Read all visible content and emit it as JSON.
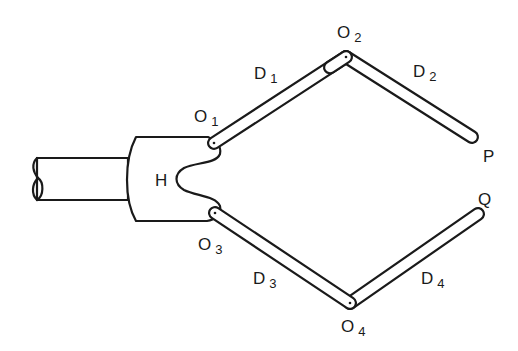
{
  "diagram": {
    "palm_label": "H",
    "joints": [
      {
        "id": "O1",
        "letter": "O",
        "sub": "1"
      },
      {
        "id": "O2",
        "letter": "O",
        "sub": "2"
      },
      {
        "id": "O3",
        "letter": "O",
        "sub": "3"
      },
      {
        "id": "O4",
        "letter": "O",
        "sub": "4"
      }
    ],
    "links": [
      {
        "id": "D1",
        "letter": "D",
        "sub": "1"
      },
      {
        "id": "D2",
        "letter": "D",
        "sub": "2"
      },
      {
        "id": "D3",
        "letter": "D",
        "sub": "3"
      },
      {
        "id": "D4",
        "letter": "D",
        "sub": "4"
      }
    ],
    "tips": [
      {
        "id": "P",
        "label": "P"
      },
      {
        "id": "Q",
        "label": "Q"
      }
    ],
    "ink_color": "#1a1a1a",
    "background": "#ffffff"
  }
}
